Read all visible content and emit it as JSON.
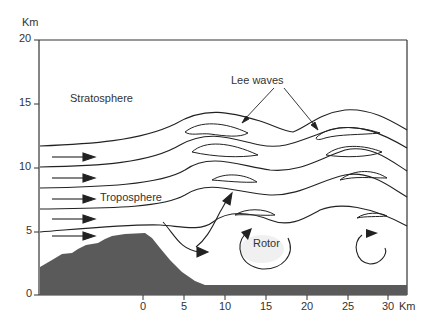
{
  "diagram": {
    "type": "cross-section",
    "axis": {
      "y_unit": "Km",
      "x_unit": "Km",
      "y_ticks": [
        "0",
        "5",
        "10",
        "15",
        "20"
      ],
      "x_ticks": [
        "0",
        "5",
        "10",
        "15",
        "20",
        "25",
        "30"
      ]
    },
    "labels": {
      "stratosphere": "Stratosphere",
      "troposphere": "Troposphere",
      "lee_waves": "Lee waves",
      "rotor": "Rotor"
    },
    "colors": {
      "terrain": "#5a5a5a",
      "line": "#222222",
      "text": "#333333"
    }
  }
}
